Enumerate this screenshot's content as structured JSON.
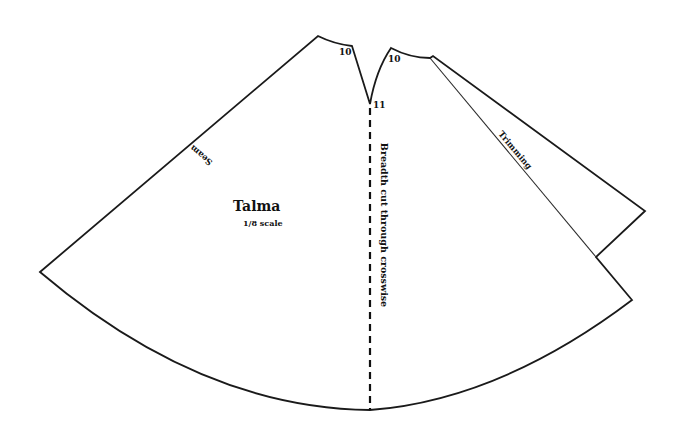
{
  "diagram": {
    "title": "Talma",
    "scale_label": "1/8 scale",
    "edge_labels": {
      "seam": "Seam",
      "trimming": "Trimming",
      "center_line": "Breadth cut through crosswise"
    },
    "point_labels": {
      "left_neck": "10",
      "right_neck": "10",
      "v_bottom": "11"
    },
    "colors": {
      "line": "#1a1a1a",
      "background": "#ffffff"
    }
  }
}
